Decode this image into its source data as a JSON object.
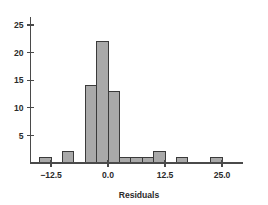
{
  "chart_data": {
    "type": "bar",
    "title": "",
    "subtitle": "",
    "xlabel": "Residuals",
    "ylabel": "",
    "xlim": [
      -17.5,
      30.0
    ],
    "ylim": [
      0,
      26.5
    ],
    "bin_width": 2.5,
    "grid": false,
    "legend": null,
    "x_ticks": [
      -12.5,
      0.0,
      12.5,
      25.0
    ],
    "x_tick_labels": [
      "−12.5",
      "0.0",
      "12.5",
      "25.0"
    ],
    "y_ticks": [
      5,
      10,
      15,
      20,
      25
    ],
    "y_tick_labels": [
      "5",
      "10",
      "15",
      "20",
      "25"
    ],
    "bar_fill_color": "#a9a9a9",
    "bar_edge_color": "#3a3a3a",
    "axis_color": "#4a4a4a",
    "bins": [
      {
        "x_left": -15.0,
        "x_right": -12.5,
        "center": -13.75,
        "count": 1
      },
      {
        "x_left": -10.0,
        "x_right": -7.5,
        "center": -8.75,
        "count": 2
      },
      {
        "x_left": -5.0,
        "x_right": -2.5,
        "center": -3.75,
        "count": 14
      },
      {
        "x_left": -2.5,
        "x_right": 0.0,
        "center": -1.25,
        "count": 22
      },
      {
        "x_left": 0.0,
        "x_right": 2.5,
        "center": 1.25,
        "count": 13
      },
      {
        "x_left": 2.5,
        "x_right": 5.0,
        "center": 3.75,
        "count": 1
      },
      {
        "x_left": 5.0,
        "x_right": 7.5,
        "center": 6.25,
        "count": 1
      },
      {
        "x_left": 7.5,
        "x_right": 10.0,
        "center": 8.75,
        "count": 1
      },
      {
        "x_left": 10.0,
        "x_right": 12.5,
        "center": 11.25,
        "count": 2
      },
      {
        "x_left": 15.0,
        "x_right": 17.5,
        "center": 16.25,
        "count": 1
      },
      {
        "x_left": 22.5,
        "x_right": 25.0,
        "center": 23.75,
        "count": 1
      }
    ],
    "categories": [
      "-13.75",
      "-8.75",
      "-3.75",
      "-1.25",
      "1.25",
      "3.75",
      "6.25",
      "8.75",
      "11.25",
      "16.25",
      "23.75"
    ],
    "values": [
      1,
      2,
      14,
      22,
      13,
      1,
      1,
      1,
      2,
      1,
      1
    ]
  }
}
